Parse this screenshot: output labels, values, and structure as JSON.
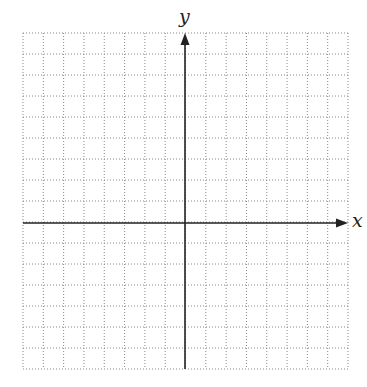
{
  "diagram": {
    "type": "coordinate-grid",
    "x_axis_label": "x",
    "y_axis_label": "y",
    "grid": {
      "columns": 16,
      "rows": 16,
      "left": 23,
      "top": 33,
      "right": 348,
      "bottom": 369,
      "line_style": "dotted",
      "line_color": "#888888"
    },
    "axes": {
      "y_axis_x": 185,
      "x_axis_y": 223,
      "color": "#222222",
      "x_arrow": "right",
      "y_arrow": "up"
    }
  }
}
